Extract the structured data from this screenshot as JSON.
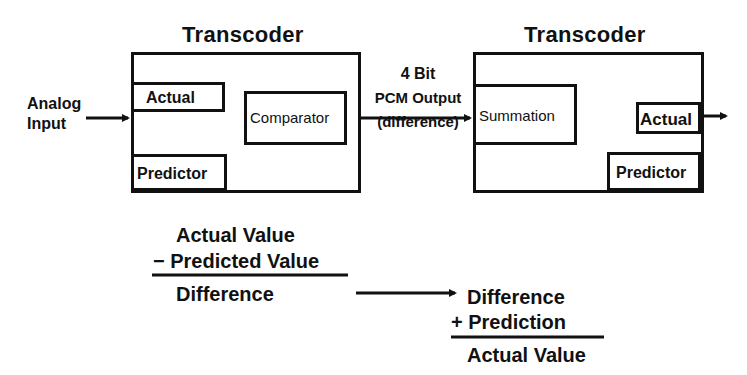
{
  "diagram": {
    "type": "block-diagram",
    "encoder": {
      "title": "Transcoder",
      "input_label_line1": "Analog",
      "input_label_line2": "Input",
      "blocks": {
        "actual": "Actual",
        "predictor": "Predictor",
        "comparator": "Comparator"
      }
    },
    "link": {
      "label_line1": "4 Bit",
      "label_line2": "PCM Output",
      "label_line3": "(difference)"
    },
    "decoder": {
      "title": "Transcoder",
      "blocks": {
        "summation": "Summation",
        "actual": "Actual",
        "predictor": "Predictor"
      }
    },
    "edges": [
      {
        "from": "Analog Input",
        "to": "Encoder Actual"
      },
      {
        "from": "Encoder Actual",
        "to": "Comparator"
      },
      {
        "from": "Encoder Predictor",
        "to": "Comparator"
      },
      {
        "from": "Comparator",
        "to": "Summation",
        "label": "4 Bit PCM Output (difference)"
      },
      {
        "from": "Summation",
        "to": "Decoder Actual"
      },
      {
        "from": "Decoder Predictor",
        "to": "Summation"
      },
      {
        "from": "Decoder Actual",
        "to": "Output"
      }
    ]
  },
  "equations": {
    "encode": {
      "line1": "Actual Value",
      "operator": "−",
      "line2": "Predicted Value",
      "result": "Difference"
    },
    "decode": {
      "line1": "Difference",
      "operator": "+",
      "line2": "Prediction",
      "result": "Actual Value"
    }
  },
  "colors": {
    "ink": "#111111",
    "background": "#ffffff"
  }
}
